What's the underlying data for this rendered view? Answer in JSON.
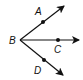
{
  "diagram": {
    "type": "rays-from-common-endpoint",
    "vertex": {
      "label": "B",
      "x": 20,
      "y": 40
    },
    "rays": [
      {
        "name": "ray-BA",
        "point": {
          "label": "A",
          "x": 43,
          "y": 21
        },
        "tip": {
          "x": 64,
          "y": 5
        }
      },
      {
        "name": "ray-BC",
        "point": {
          "label": "C",
          "x": 58,
          "y": 40
        },
        "tip": {
          "x": 80,
          "y": 40
        }
      },
      {
        "name": "ray-BD",
        "point": {
          "label": "D",
          "x": 44,
          "y": 61
        },
        "tip": {
          "x": 64,
          "y": 76
        }
      }
    ],
    "labels": {
      "A": "A",
      "B": "B",
      "C": "C",
      "D": "D"
    },
    "colors": {
      "stroke": "#111111",
      "background": "#ffffff"
    }
  }
}
